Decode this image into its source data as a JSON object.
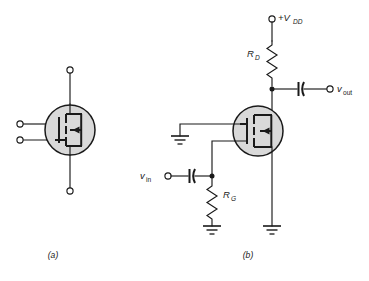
{
  "figure": {
    "kind": "circuit-diagram",
    "background_color": "#ffffff",
    "line_color": "#1a1a1a",
    "device_fill_color": "#d9d9d9"
  },
  "panel_a": {
    "caption": "(a)",
    "device_name": "mosfet-symbol",
    "terminals": [
      {
        "name": "drain-terminal",
        "position": "top"
      },
      {
        "name": "gate-terminal",
        "position": "left-upper"
      },
      {
        "name": "body-terminal",
        "position": "left-lower"
      },
      {
        "name": "source-terminal",
        "position": "bottom"
      }
    ]
  },
  "panel_b": {
    "caption": "(b)",
    "labels": {
      "supply": "+V",
      "supply_sub": "DD",
      "drain_resistor": "R",
      "drain_resistor_sub": "D",
      "gate_resistor": "R",
      "gate_resistor_sub": "G",
      "input": "v",
      "input_sub": "in",
      "output": "v",
      "output_sub": "out"
    },
    "components": [
      {
        "name": "supply-terminal",
        "label": "+V_DD"
      },
      {
        "name": "drain-resistor",
        "label": "R_D"
      },
      {
        "name": "gate-resistor",
        "label": "R_G"
      },
      {
        "name": "input-coupling-capacitor",
        "label": ""
      },
      {
        "name": "output-coupling-capacitor",
        "label": ""
      },
      {
        "name": "mosfet-symbol",
        "label": ""
      },
      {
        "name": "input-terminal",
        "label": "v_in"
      },
      {
        "name": "output-terminal",
        "label": "v_out"
      },
      {
        "name": "body-ground",
        "label": ""
      },
      {
        "name": "gate-resistor-ground",
        "label": ""
      },
      {
        "name": "source-ground",
        "label": ""
      }
    ]
  }
}
